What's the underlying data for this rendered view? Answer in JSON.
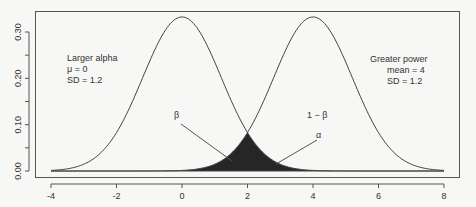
{
  "chart_data": {
    "type": "line",
    "title": "",
    "xlabel": "",
    "ylabel": "",
    "xlim": [
      -4,
      8
    ],
    "ylim": [
      0,
      0.33
    ],
    "x_ticks": [
      "-4",
      "-2",
      "0",
      "2",
      "4",
      "6",
      "8"
    ],
    "y_ticks": [
      "0.00",
      "0.10",
      "0.20",
      "0.30"
    ],
    "grid": false,
    "series": [
      {
        "name": "Null distribution",
        "mean": 0,
        "sd": 1.2
      },
      {
        "name": "Alternative distribution",
        "mean": 4,
        "sd": 1.2
      }
    ],
    "shaded_region": {
      "description": "overlap of both curves (beta and alpha areas)",
      "x_from": -4,
      "x_to": 8,
      "boundary_x": 2,
      "color": "#2a2a2a"
    },
    "annotations": {
      "left_title": "Larger alpha",
      "left_mu": "μ = 0",
      "left_sd": "SD = 1.2",
      "right_title": "Greater power",
      "right_mean": "mean = 4",
      "right_sd": "SD = 1.2",
      "beta": "β",
      "one_minus_beta": "1 − β",
      "alpha": "α"
    }
  }
}
